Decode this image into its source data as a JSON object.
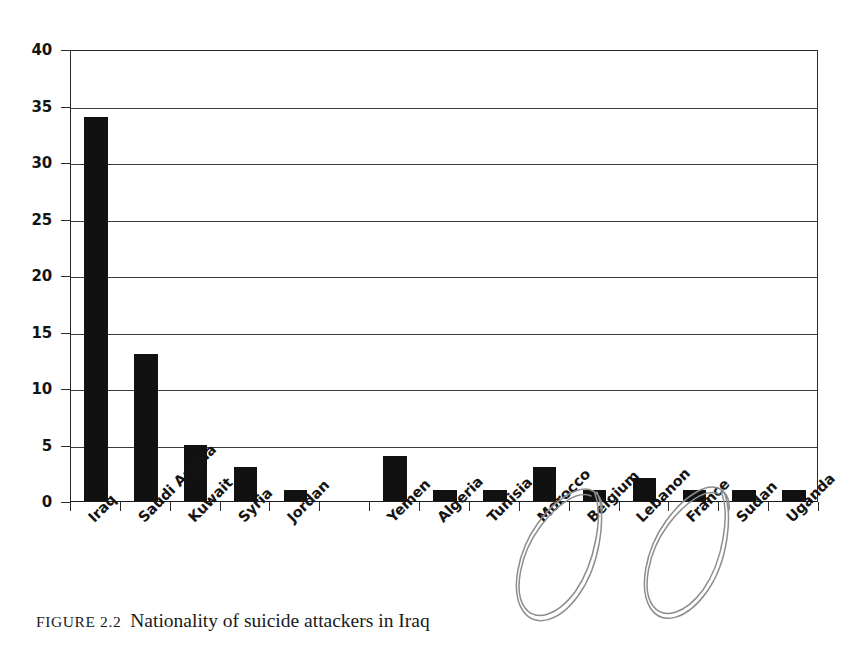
{
  "caption": {
    "figure_label": "FIGURE 2.2",
    "text": "Nationality of suicide attackers in Iraq"
  },
  "chart_data": {
    "type": "bar",
    "title": "Nationality of suicide attackers in Iraq",
    "xlabel": "",
    "ylabel": "",
    "ylim": [
      0,
      40
    ],
    "ytick_step": 5,
    "yticks": [
      "0",
      "5",
      "10",
      "15",
      "20",
      "25",
      "30",
      "35",
      "40"
    ],
    "grid": true,
    "legend": "none",
    "bar_color": "#111111",
    "categories": [
      "Iraq",
      "Saudi Arabia",
      "Kuwait",
      "Syria",
      "Jordan",
      "",
      "Yemen",
      "Algeria",
      "Tunisia",
      "Morocco",
      "Belgium",
      "Lebanon",
      "France",
      "Sudan",
      "Uganda"
    ],
    "values": [
      34,
      13,
      5,
      3,
      1,
      0,
      4,
      1,
      1,
      3,
      1,
      2,
      1,
      1,
      1
    ],
    "annotations": [
      {
        "name": "ellipse-belgium",
        "target": "Belgium",
        "shape": "hand-drawn-ellipse"
      },
      {
        "name": "ellipse-france",
        "target": "France",
        "shape": "hand-drawn-ellipse"
      }
    ]
  }
}
